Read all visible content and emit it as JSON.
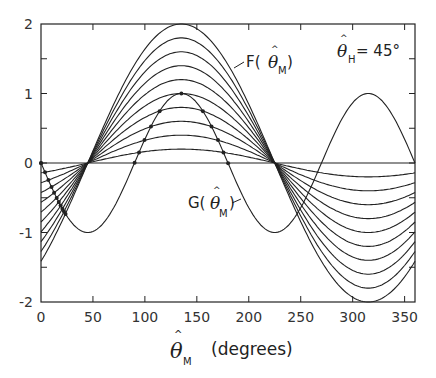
{
  "chart_data": {
    "type": "line",
    "title": "",
    "xlabel": "θ̂_M (degrees)",
    "xlabel_symbol": "θ",
    "xlabel_hat": "^",
    "xlabel_sub": "M",
    "xlabel_unit": "(degrees)",
    "ylabel": "",
    "xlim": [
      0,
      360
    ],
    "ylim": [
      -2,
      2
    ],
    "x_ticks": [
      0,
      50,
      100,
      150,
      200,
      250,
      300,
      350
    ],
    "x_tick_labels": [
      "0",
      "50",
      "100",
      "150",
      "200",
      "250",
      "300",
      "350"
    ],
    "y_ticks_major": [
      -2,
      -1,
      0,
      1,
      2
    ],
    "y_tick_labels": [
      "-2",
      "-1",
      "0",
      "1",
      "2"
    ],
    "y_ticks_minor": [
      -1.5,
      -0.5,
      0.5,
      1.5
    ],
    "grid": false,
    "series": [
      {
        "name": "F(θ̂_M)",
        "formula": "A*sin(θ-45°)",
        "amplitudes": [
          0,
          0.2,
          0.4,
          0.6,
          0.8,
          1.0,
          1.2,
          1.4,
          1.6,
          1.8,
          2.0
        ],
        "peak_x": 135,
        "trough_x": 315,
        "zeros_x": [
          45,
          225
        ]
      },
      {
        "name": "G(θ̂_M)",
        "formula": "-sin(2θ)",
        "amplitude": 1.0,
        "maxima_x": [
          135,
          315
        ],
        "minima_x": [
          45,
          225
        ],
        "zeros_x": [
          0,
          90,
          180,
          270,
          360
        ]
      }
    ],
    "markers": "dots at intersections of G with each F curve",
    "annotations": [
      {
        "text": "F(θ̂_M)",
        "x": 165,
        "y": 1.55
      },
      {
        "text": "G(θ̂_M)",
        "x": 165,
        "y": -0.6
      },
      {
        "text": "θ̂_H = 45°",
        "x": 295,
        "y": 1.6
      }
    ]
  },
  "labels": {
    "f_label_prefix": "F(",
    "f_label_suffix": ")",
    "g_label_prefix": "G(",
    "g_label_suffix": ")",
    "theta": "θ",
    "hat": "^",
    "sub_m": "M",
    "sub_h": "H",
    "param_value": "= 45°"
  }
}
